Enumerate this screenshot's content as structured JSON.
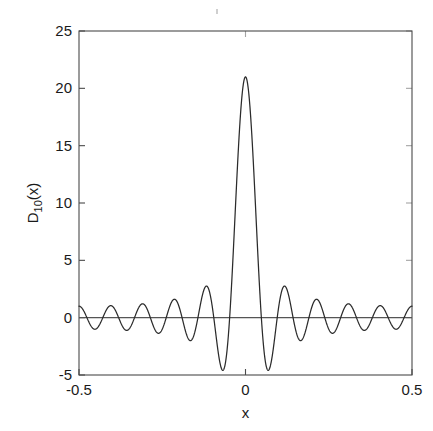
{
  "figure": {
    "background_color": "#ffffff",
    "curve_color": "#2b2b2b",
    "axis_color": "#4a4a4a",
    "zero_line_color": "#555555"
  },
  "chart_data": {
    "type": "line",
    "title": "",
    "subtitle": "",
    "xlabel": "x",
    "ylabel": "D_10(x)",
    "ylabel_base": "D",
    "ylabel_subscript": "10",
    "ylabel_arg": "(x)",
    "xlim": [
      -0.5,
      0.5
    ],
    "ylim": [
      -5,
      25
    ],
    "xticks": [
      -0.5,
      0,
      0.5
    ],
    "xtick_labels": [
      "-0.5",
      "0",
      "0.5"
    ],
    "yticks": [
      -5,
      0,
      5,
      10,
      15,
      20,
      25
    ],
    "ytick_labels": [
      "-5",
      "0",
      "5",
      "10",
      "15",
      "20",
      "25"
    ],
    "grid": false,
    "legend": "none",
    "series": [
      {
        "name": "D_10(x)",
        "formula": "sin(21*pi*x)/sin(pi*x)",
        "order_n": 10,
        "peak_value": 21,
        "peak_x": 0,
        "n_samples": 2001,
        "first_minimum_value": -4.6,
        "first_minimum_x": -0.0675,
        "edge_value_at_minus_half": 1,
        "edge_value_at_plus_half": 1,
        "zero_crossings_per_side": 10,
        "annotations": []
      }
    ]
  },
  "axes_geometry": {
    "left_px": 79,
    "right_px": 412,
    "top_px": 31,
    "bottom_px": 375
  }
}
